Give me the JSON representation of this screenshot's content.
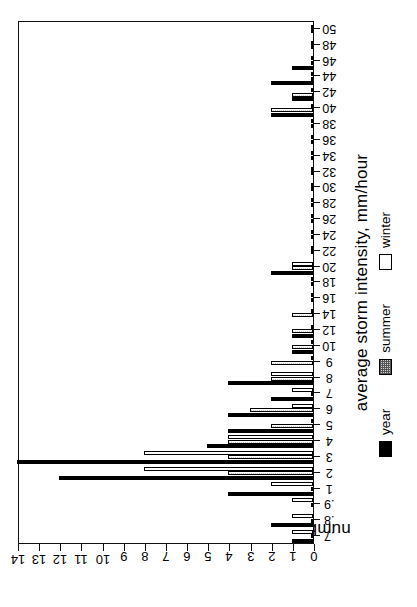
{
  "chart_data": {
    "type": "bar",
    "title": "",
    "ylabel": "number of storms",
    "xlabel": "average storm intensity, mm/hour",
    "ylim": [
      0,
      14
    ],
    "yticks": [
      0,
      1,
      2,
      3,
      4,
      5,
      6,
      7,
      8,
      9,
      10,
      11,
      12,
      13,
      14
    ],
    "grid": false,
    "legend_position": "below-axis",
    "orientation": "rotated-90-ccw",
    "categories": [
      ".7",
      ".8",
      ".9",
      "1",
      "2",
      "3",
      "4",
      "5",
      "6",
      "7",
      "8",
      "9",
      "10",
      "12",
      "14",
      "16",
      "18",
      "20",
      "22",
      "24",
      "26",
      "28",
      "30",
      "32",
      "34",
      "36",
      "38",
      "40",
      "42",
      "44",
      "46",
      "48",
      "50"
    ],
    "series": [
      {
        "name": "year",
        "color": "#000000",
        "pattern": "solid",
        "values": [
          1,
          2,
          0,
          4,
          12,
          14,
          5,
          4,
          4,
          2,
          4,
          0,
          1,
          1,
          0,
          0,
          0,
          2,
          0,
          0,
          0,
          0,
          0,
          0,
          0,
          0,
          0,
          2,
          1,
          2,
          1,
          0,
          0
        ]
      },
      {
        "name": "summer",
        "color": "#c9c9c9",
        "pattern": "stipple",
        "values": [
          0,
          0,
          0,
          0,
          4,
          4,
          4,
          2,
          3,
          0,
          2,
          2,
          1,
          1,
          1,
          0,
          0,
          1,
          0,
          0,
          0,
          0,
          0,
          0,
          0,
          0,
          0,
          2,
          1,
          0,
          0,
          0,
          0
        ]
      },
      {
        "name": "winter",
        "color": "#ffffff",
        "pattern": "open",
        "values": [
          1,
          1,
          1,
          2,
          8,
          8,
          4,
          0,
          1,
          1,
          2,
          0,
          0,
          0,
          0,
          0,
          0,
          1,
          0,
          0,
          0,
          0,
          0,
          0,
          0,
          0,
          0,
          0,
          0,
          0,
          0,
          0,
          0
        ]
      }
    ]
  },
  "legend": {
    "items": [
      {
        "label": "year"
      },
      {
        "label": "summer"
      },
      {
        "label": "winter"
      }
    ]
  }
}
